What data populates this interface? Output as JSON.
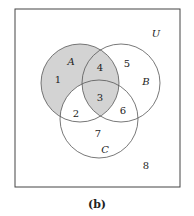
{
  "figure": {
    "caption": "(b)",
    "universe_label": "U",
    "sets": [
      {
        "label": "A",
        "cx": 80,
        "cy": 83,
        "r": 39,
        "lx": 71,
        "ly": 65
      },
      {
        "label": "B",
        "cx": 121,
        "cy": 83,
        "r": 39,
        "lx": 146,
        "ly": 85
      },
      {
        "label": "C",
        "cx": 99,
        "cy": 119,
        "r": 39,
        "lx": 105,
        "ly": 153
      }
    ],
    "regions": [
      {
        "label": "1",
        "x": 58,
        "y": 80
      },
      {
        "label": "2",
        "x": 76,
        "y": 114
      },
      {
        "label": "3",
        "x": 100,
        "y": 99
      },
      {
        "label": "4",
        "x": 100,
        "y": 70
      },
      {
        "label": "5",
        "x": 127,
        "y": 66
      },
      {
        "label": "6",
        "x": 123,
        "y": 112
      },
      {
        "label": "7",
        "x": 98,
        "y": 135
      },
      {
        "label": "8",
        "x": 146,
        "y": 168
      }
    ],
    "shaded_regions": [
      "1",
      "3",
      "4"
    ],
    "shade_color": "#d3d3d3",
    "stroke_color": "#555555"
  }
}
